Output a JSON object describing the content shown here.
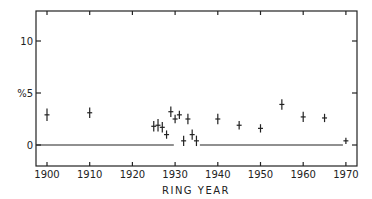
{
  "chart_data": {
    "type": "scatter",
    "title": "",
    "xlabel": "RING YEAR",
    "ylabel": "%",
    "xlim": [
      1897.5,
      1972.5
    ],
    "ylim": [
      -2,
      13
    ],
    "x_ticks": [
      1900,
      1910,
      1920,
      1930,
      1940,
      1950,
      1960,
      1970
    ],
    "x_tick_labels": [
      "1900",
      "1910",
      "1920",
      "1930",
      "1940",
      "1950",
      "1960",
      "1970"
    ],
    "y_ticks": [
      0,
      5,
      10
    ],
    "y_tick_labels": [
      "0",
      "%5",
      "10"
    ],
    "grid": false,
    "legend": null,
    "series": [
      {
        "name": "measurements",
        "marker": "cross-with-error-bar",
        "x": [
          1900,
          1910,
          1925,
          1926,
          1927,
          1928,
          1929,
          1930,
          1931,
          1932,
          1933,
          1934,
          1935,
          1940,
          1945,
          1950,
          1955,
          1960,
          1965,
          1970
        ],
        "y": [
          2.9,
          3.1,
          1.8,
          1.9,
          1.7,
          1.0,
          3.2,
          2.5,
          2.9,
          0.4,
          2.5,
          1.0,
          0.4,
          2.5,
          1.9,
          1.6,
          3.9,
          2.7,
          2.6,
          0.4
        ],
        "yerr": [
          0.6,
          0.5,
          0.5,
          0.6,
          0.5,
          0.4,
          0.5,
          0.4,
          0.4,
          0.5,
          0.5,
          0.5,
          0.5,
          0.5,
          0.4,
          0.4,
          0.5,
          0.5,
          0.4,
          0.3
        ]
      }
    ],
    "reference_lines": [
      {
        "y": 0,
        "x_start": 1897.5,
        "x_end": 1929.7
      },
      {
        "y": 0,
        "x_start": 1935.8,
        "x_end": 1969.3
      }
    ]
  }
}
